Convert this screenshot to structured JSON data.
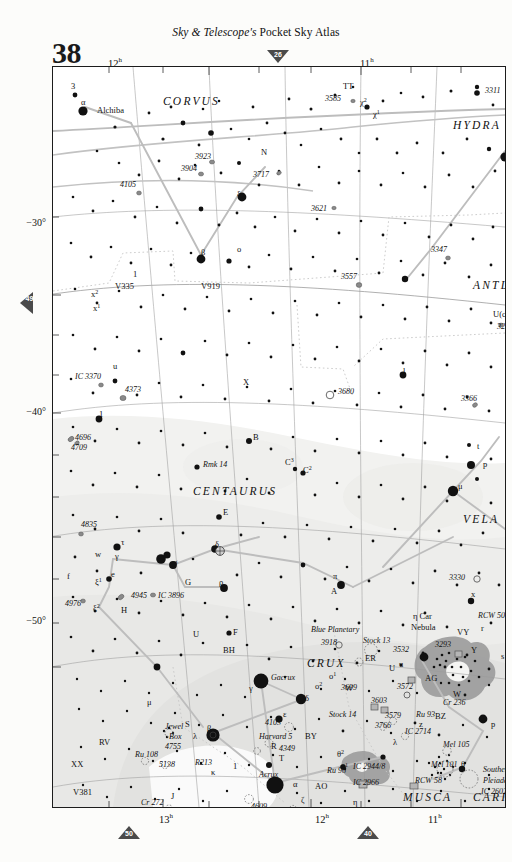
{
  "header": {
    "masthead_italic": "Sky & Telescope's",
    "masthead_rest": " Pocket Sky Atlas",
    "page_number": "38"
  },
  "page_links": {
    "top": "26",
    "left": "49",
    "bottom_left": "50",
    "bottom_right": "40"
  },
  "axes": {
    "dec_labels": [
      "−30°",
      "−40°",
      "−50°"
    ],
    "ra_top": [
      "12",
      "11"
    ],
    "ra_bottom": [
      "13",
      "12",
      "11"
    ],
    "ra_super": "h"
  },
  "constellations": [
    {
      "name": "CORVUS",
      "x": 110,
      "y": 38
    },
    {
      "name": "HYDRA",
      "x": 400,
      "y": 62
    },
    {
      "name": "ANTLIA",
      "x": 420,
      "y": 222
    },
    {
      "name": "CENTAURUS",
      "x": 140,
      "y": 428
    },
    {
      "name": "VELA",
      "x": 410,
      "y": 456
    },
    {
      "name": "CRUX",
      "x": 254,
      "y": 600
    },
    {
      "name": "MUSCA",
      "x": 350,
      "y": 734
    },
    {
      "name": "CARINA",
      "x": 420,
      "y": 734
    }
  ],
  "deep_sky": [
    {
      "label": "3923",
      "x": 142,
      "y": 92
    },
    {
      "label": "3904",
      "x": 128,
      "y": 104
    },
    {
      "label": "3717",
      "x": 200,
      "y": 110
    },
    {
      "label": "4105",
      "x": 67,
      "y": 120
    },
    {
      "label": "3621",
      "x": 258,
      "y": 144
    },
    {
      "label": "3585",
      "x": 272,
      "y": 34
    },
    {
      "label": "3311",
      "x": 432,
      "y": 26
    },
    {
      "label": "3347",
      "x": 378,
      "y": 185
    },
    {
      "label": "3557",
      "x": 288,
      "y": 212
    },
    {
      "label": "3250",
      "x": 444,
      "y": 262
    },
    {
      "label": "3680",
      "x": 285,
      "y": 327
    },
    {
      "label": "3366",
      "x": 408,
      "y": 334
    },
    {
      "label": "IC 3370",
      "x": 22,
      "y": 312
    },
    {
      "label": "4373",
      "x": 72,
      "y": 325
    },
    {
      "label": "4696",
      "x": 22,
      "y": 373
    },
    {
      "label": "4709",
      "x": 18,
      "y": 383
    },
    {
      "label": "4835",
      "x": 28,
      "y": 460
    },
    {
      "label": "4945",
      "x": 78,
      "y": 531
    },
    {
      "label": "IC 3896",
      "x": 105,
      "y": 531
    },
    {
      "label": "4976",
      "x": 12,
      "y": 539
    },
    {
      "label": "3330",
      "x": 396,
      "y": 513
    },
    {
      "label": "RCW 50",
      "x": 425,
      "y": 551
    },
    {
      "label": "3293",
      "x": 382,
      "y": 580
    },
    {
      "label": "3918",
      "x": 268,
      "y": 578
    },
    {
      "label": "Blue Planetary",
      "x": 258,
      "y": 565
    },
    {
      "label": "Stock 13",
      "x": 310,
      "y": 576
    },
    {
      "label": "3532",
      "x": 340,
      "y": 585
    },
    {
      "label": "3699",
      "x": 288,
      "y": 623
    },
    {
      "label": "3572",
      "x": 344,
      "y": 622
    },
    {
      "label": "3603",
      "x": 318,
      "y": 636
    },
    {
      "label": "3579",
      "x": 332,
      "y": 651
    },
    {
      "label": "Ru 93",
      "x": 363,
      "y": 650
    },
    {
      "label": "Cr 236",
      "x": 390,
      "y": 638
    },
    {
      "label": "Stock 14",
      "x": 276,
      "y": 650
    },
    {
      "label": "3766",
      "x": 322,
      "y": 661
    },
    {
      "label": "IC 2714",
      "x": 352,
      "y": 667
    },
    {
      "label": "Mel 105",
      "x": 390,
      "y": 680
    },
    {
      "label": "Mel 101",
      "x": 378,
      "y": 700
    },
    {
      "label": "RCW 58",
      "x": 362,
      "y": 716
    },
    {
      "label": "IC 2944/8",
      "x": 300,
      "y": 702
    },
    {
      "label": "IC 2966",
      "x": 300,
      "y": 718
    },
    {
      "label": "Ru 98",
      "x": 274,
      "y": 706
    },
    {
      "label": "Southern",
      "x": 430,
      "y": 705
    },
    {
      "label": "Pleiades",
      "x": 430,
      "y": 716
    },
    {
      "label": "IC 2602",
      "x": 428,
      "y": 727
    },
    {
      "label": "4103",
      "x": 212,
      "y": 658
    },
    {
      "label": "Harvard 5",
      "x": 206,
      "y": 672
    },
    {
      "label": "4349",
      "x": 226,
      "y": 684
    },
    {
      "label": "Jewel",
      "x": 112,
      "y": 662
    },
    {
      "label": "Box",
      "x": 116,
      "y": 672
    },
    {
      "label": "4755",
      "x": 112,
      "y": 682
    },
    {
      "label": "Ru 108",
      "x": 82,
      "y": 690
    },
    {
      "label": "5138",
      "x": 106,
      "y": 700
    },
    {
      "label": "R213",
      "x": 142,
      "y": 698
    },
    {
      "label": "Cr 272",
      "x": 88,
      "y": 738
    },
    {
      "label": "Coalsack",
      "x": 148,
      "y": 747
    },
    {
      "label": "4609",
      "x": 198,
      "y": 742
    },
    {
      "label": "4463",
      "x": 238,
      "y": 754
    },
    {
      "label": "Rmk 14",
      "x": 150,
      "y": 400
    },
    {
      "label": "Gacrux",
      "x": 218,
      "y": 613
    },
    {
      "label": "Acrux",
      "x": 206,
      "y": 710
    }
  ],
  "star_labels": [
    {
      "label": "3",
      "x": 18,
      "y": 22
    },
    {
      "label": "α",
      "x": 28,
      "y": 38
    },
    {
      "label": "Alchiba",
      "x": 44,
      "y": 46
    },
    {
      "label": "TT",
      "x": 290,
      "y": 22
    },
    {
      "label": "χ",
      "x": 307,
      "y": 38,
      "sup": "2"
    },
    {
      "label": "χ",
      "x": 320,
      "y": 50,
      "sup": "1"
    },
    {
      "label": "δ",
      "x": 452,
      "y": 78
    },
    {
      "label": "α",
      "x": 456,
      "y": 90
    },
    {
      "label": "N",
      "x": 208,
      "y": 88
    },
    {
      "label": "ξ",
      "x": 184,
      "y": 130
    },
    {
      "label": "β",
      "x": 148,
      "y": 188
    },
    {
      "label": "o",
      "x": 184,
      "y": 185
    },
    {
      "label": "V335",
      "x": 62,
      "y": 222
    },
    {
      "label": "V919",
      "x": 148,
      "y": 222
    },
    {
      "label": "x",
      "x": 38,
      "y": 230,
      "sup": "2"
    },
    {
      "label": "x",
      "x": 40,
      "y": 244,
      "sup": "1"
    },
    {
      "label": "u",
      "x": 60,
      "y": 302
    },
    {
      "label": "1",
      "x": 46,
      "y": 350
    },
    {
      "label": "U(c)",
      "x": 440,
      "y": 250
    },
    {
      "label": "l",
      "x": 350,
      "y": 307
    },
    {
      "label": "X",
      "x": 190,
      "y": 318
    },
    {
      "label": "B",
      "x": 200,
      "y": 373
    },
    {
      "label": "C",
      "x": 232,
      "y": 398,
      "sup": "3"
    },
    {
      "label": "C",
      "x": 250,
      "y": 406,
      "sup": "2"
    },
    {
      "label": "E",
      "x": 170,
      "y": 448
    },
    {
      "label": "t",
      "x": 424,
      "y": 382
    },
    {
      "label": "p",
      "x": 430,
      "y": 400
    },
    {
      "label": "μ",
      "x": 405,
      "y": 422
    },
    {
      "label": "δ",
      "x": 162,
      "y": 480
    },
    {
      "label": "τ",
      "x": 68,
      "y": 478
    },
    {
      "label": "γ",
      "x": 62,
      "y": 492
    },
    {
      "label": "w",
      "x": 42,
      "y": 490
    },
    {
      "label": "e",
      "x": 58,
      "y": 510
    },
    {
      "label": "f",
      "x": 14,
      "y": 512
    },
    {
      "label": "ξ",
      "x": 42,
      "y": 518,
      "sup": "1"
    },
    {
      "label": "ξ",
      "x": 40,
      "y": 544,
      "sup": "2"
    },
    {
      "label": "H",
      "x": 68,
      "y": 546
    },
    {
      "label": "σ",
      "x": 120,
      "y": 498
    },
    {
      "label": "G",
      "x": 132,
      "y": 518
    },
    {
      "label": "ρ",
      "x": 166,
      "y": 518
    },
    {
      "label": "π",
      "x": 280,
      "y": 512
    },
    {
      "label": "A",
      "x": 278,
      "y": 527
    },
    {
      "label": "x",
      "x": 418,
      "y": 530
    },
    {
      "label": "U",
      "x": 140,
      "y": 570
    },
    {
      "label": "F",
      "x": 180,
      "y": 568
    },
    {
      "label": "BH",
      "x": 170,
      "y": 586
    },
    {
      "label": "W",
      "x": 292,
      "y": 624
    },
    {
      "label": "γ",
      "x": 196,
      "y": 624
    },
    {
      "label": "δ",
      "x": 252,
      "y": 634
    },
    {
      "label": "ε",
      "x": 230,
      "y": 650
    },
    {
      "label": "β",
      "x": 154,
      "y": 664
    },
    {
      "label": "μ",
      "x": 94,
      "y": 638
    },
    {
      "label": "λ",
      "x": 140,
      "y": 672
    },
    {
      "label": "S",
      "x": 132,
      "y": 660
    },
    {
      "label": "κ",
      "x": 158,
      "y": 708
    },
    {
      "label": "1",
      "x": 180,
      "y": 702
    },
    {
      "label": "α",
      "x": 240,
      "y": 720
    },
    {
      "label": "AO",
      "x": 262,
      "y": 722
    },
    {
      "label": "ζ",
      "x": 248,
      "y": 736
    },
    {
      "label": "R",
      "x": 218,
      "y": 682
    },
    {
      "label": "T",
      "x": 226,
      "y": 694
    },
    {
      "label": "BY",
      "x": 252,
      "y": 672
    },
    {
      "label": "θ",
      "x": 284,
      "y": 690,
      "sup": "2"
    },
    {
      "label": "θ",
      "x": 288,
      "y": 703,
      "sup": "1"
    },
    {
      "label": "η",
      "x": 300,
      "y": 738
    },
    {
      "label": "θ",
      "x": 408,
      "y": 700
    },
    {
      "label": "p",
      "x": 438,
      "y": 660
    },
    {
      "label": "λ",
      "x": 340,
      "y": 678
    },
    {
      "label": "o",
      "x": 276,
      "y": 612,
      "sup": "1"
    },
    {
      "label": "o",
      "x": 262,
      "y": 622,
      "sup": "2"
    },
    {
      "label": "ER",
      "x": 312,
      "y": 594
    },
    {
      "label": "U",
      "x": 336,
      "y": 604
    },
    {
      "label": "u",
      "x": 346,
      "y": 600
    },
    {
      "label": "AG",
      "x": 372,
      "y": 614
    },
    {
      "label": "VY",
      "x": 404,
      "y": 568
    },
    {
      "label": "r",
      "x": 428,
      "y": 564
    },
    {
      "label": "Y",
      "x": 418,
      "y": 586
    },
    {
      "label": "s",
      "x": 448,
      "y": 592
    },
    {
      "label": "W",
      "x": 400,
      "y": 630
    },
    {
      "label": "BZ",
      "x": 382,
      "y": 652
    },
    {
      "label": "z",
      "x": 366,
      "y": 660
    },
    {
      "label": "η Car",
      "x": 360,
      "y": 552
    },
    {
      "label": "Nebula",
      "x": 358,
      "y": 563
    },
    {
      "label": "RV",
      "x": 46,
      "y": 678
    },
    {
      "label": "XX",
      "x": 18,
      "y": 700
    },
    {
      "label": "V381",
      "x": 20,
      "y": 728
    },
    {
      "label": "J",
      "x": 118,
      "y": 732
    },
    {
      "label": "1",
      "x": 80,
      "y": 210
    }
  ],
  "colors": {
    "frame": "#1c1c1c",
    "star": "#111111",
    "milky_way": "#f0f0ee",
    "milky_way_dense": "#e4e4e2",
    "nebula": "#9a9a9a",
    "ecliptic": "#b8b8b8",
    "const_line": "#b5b5b5",
    "grid": "#8f8f8f",
    "boundary_dot": "#aaaaaa",
    "tri": "#4a4a4a",
    "paper": "#fcfcfa"
  }
}
